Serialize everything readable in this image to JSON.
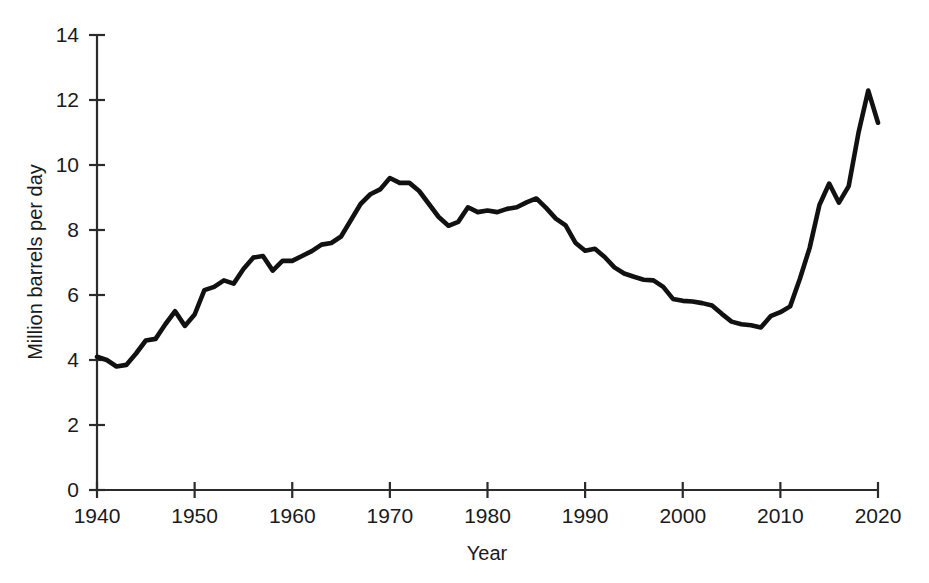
{
  "chart_data": {
    "type": "line",
    "title": "",
    "subtitle": "",
    "xlabel": "Year",
    "ylabel": "Million barrels per day",
    "xlim": [
      1940,
      2020
    ],
    "ylim": [
      0,
      14
    ],
    "xticks": [
      1940,
      1950,
      1960,
      1970,
      1980,
      1990,
      2000,
      2010,
      2020
    ],
    "xtick_labels": [
      "1940",
      "1950",
      "1960",
      "1970",
      "1980",
      "1990",
      "2000",
      "2010",
      "2020"
    ],
    "yticks": [
      0,
      2,
      4,
      6,
      8,
      10,
      12,
      14
    ],
    "ytick_labels": [
      "0",
      "2",
      "4",
      "6",
      "8",
      "10",
      "12",
      "14"
    ],
    "grid": false,
    "legend": false,
    "legend_position": "none",
    "line_color": "#111111",
    "background_color": "#ffffff",
    "x": [
      1940,
      1941,
      1942,
      1943,
      1944,
      1945,
      1946,
      1947,
      1948,
      1949,
      1950,
      1951,
      1952,
      1953,
      1954,
      1955,
      1956,
      1957,
      1958,
      1959,
      1960,
      1961,
      1962,
      1963,
      1964,
      1965,
      1966,
      1967,
      1968,
      1969,
      1970,
      1971,
      1972,
      1973,
      1974,
      1975,
      1976,
      1977,
      1978,
      1979,
      1980,
      1981,
      1982,
      1983,
      1984,
      1985,
      1986,
      1987,
      1988,
      1989,
      1990,
      1991,
      1992,
      1993,
      1994,
      1995,
      1996,
      1997,
      1998,
      1999,
      2000,
      2001,
      2002,
      2003,
      2004,
      2005,
      2006,
      2007,
      2008,
      2009,
      2010,
      2011,
      2012,
      2013,
      2014,
      2015,
      2016,
      2017,
      2018,
      2019,
      2020
    ],
    "y": [
      4.1,
      4.0,
      3.8,
      3.85,
      4.2,
      4.6,
      4.65,
      5.1,
      5.5,
      5.05,
      5.4,
      6.15,
      6.25,
      6.45,
      6.35,
      6.8,
      7.15,
      7.2,
      6.75,
      7.05,
      7.05,
      7.2,
      7.35,
      7.55,
      7.6,
      7.8,
      8.3,
      8.8,
      9.1,
      9.25,
      9.6,
      9.45,
      9.45,
      9.2,
      8.8,
      8.4,
      8.13,
      8.25,
      8.7,
      8.55,
      8.6,
      8.55,
      8.65,
      8.7,
      8.85,
      8.97,
      8.68,
      8.35,
      8.14,
      7.61,
      7.36,
      7.42,
      7.17,
      6.85,
      6.66,
      6.56,
      6.47,
      6.45,
      6.25,
      5.88,
      5.82,
      5.8,
      5.75,
      5.68,
      5.42,
      5.18,
      5.1,
      5.07,
      5.0,
      5.35,
      5.47,
      5.65,
      6.5,
      7.45,
      8.77,
      9.43,
      8.84,
      9.35,
      10.99,
      12.29,
      11.3
    ],
    "series_name": "U.S. crude oil production"
  },
  "axis": {
    "y_title": "Million barrels per day",
    "x_title": "Year"
  }
}
